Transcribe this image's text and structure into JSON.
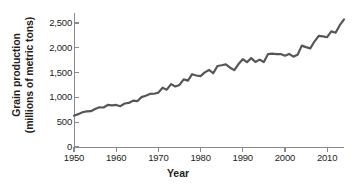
{
  "chart_data": {
    "type": "line",
    "title": "",
    "xlabel": "Year",
    "ylabel": "Grain production (millions of metric tons)",
    "ylabel_line1": "Grain production",
    "ylabel_line2": "(millions of metric tons)",
    "xlim": [
      1950,
      2014
    ],
    "ylim": [
      0,
      2700
    ],
    "grid": false,
    "legend": null,
    "line_color": "#565656",
    "axis_color": "#8a8a8a",
    "text_color": "#231f20",
    "yticks": [
      0,
      500,
      1000,
      1500,
      2000,
      2500
    ],
    "ytick_labels": [
      "0",
      "500",
      "1,000",
      "1,500",
      "2,000",
      "2,500"
    ],
    "xticks": [
      1950,
      1960,
      1970,
      1980,
      1990,
      2000,
      2010
    ],
    "xtick_labels": [
      "1950",
      "1960",
      "1970",
      "1980",
      "1990",
      "2000",
      "2010"
    ],
    "series": [
      {
        "name": "World grain production",
        "x": [
          1950,
          1951,
          1952,
          1953,
          1954,
          1955,
          1956,
          1957,
          1958,
          1959,
          1960,
          1961,
          1962,
          1963,
          1964,
          1965,
          1966,
          1967,
          1968,
          1969,
          1970,
          1971,
          1972,
          1973,
          1974,
          1975,
          1976,
          1977,
          1978,
          1979,
          1980,
          1981,
          1982,
          1983,
          1984,
          1985,
          1986,
          1987,
          1988,
          1989,
          1990,
          1991,
          1992,
          1993,
          1994,
          1995,
          1996,
          1997,
          1998,
          1999,
          2000,
          2001,
          2002,
          2003,
          2004,
          2005,
          2006,
          2007,
          2008,
          2009,
          2010,
          2011,
          2012,
          2013,
          2014
        ],
        "values": [
          631,
          662,
          700,
          717,
          722,
          766,
          800,
          796,
          847,
          839,
          847,
          822,
          877,
          888,
          935,
          923,
          1005,
          1033,
          1070,
          1073,
          1096,
          1194,
          1156,
          1267,
          1219,
          1250,
          1363,
          1337,
          1467,
          1441,
          1429,
          1503,
          1552,
          1486,
          1632,
          1647,
          1665,
          1598,
          1549,
          1671,
          1769,
          1708,
          1791,
          1714,
          1760,
          1712,
          1872,
          1881,
          1873,
          1873,
          1840,
          1876,
          1821,
          1857,
          2043,
          2012,
          1988,
          2125,
          2238,
          2230,
          2212,
          2330,
          2302,
          2455,
          2573
        ]
      }
    ]
  }
}
